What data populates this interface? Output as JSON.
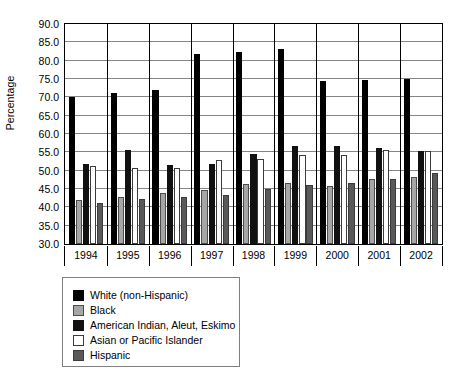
{
  "chart_data": {
    "type": "bar",
    "title": "",
    "subtitle": "",
    "xlabel": "",
    "ylabel": "Percentage",
    "categories": [
      "1994",
      "1995",
      "1996",
      "1997",
      "1998",
      "1999",
      "2000",
      "2001",
      "2002"
    ],
    "ylim": [
      30.0,
      90.0
    ],
    "ytick_step": 5.0,
    "yticks": [
      "90.0",
      "85.0",
      "80.0",
      "75.0",
      "70.0",
      "65.0",
      "60.0",
      "55.0",
      "50.0",
      "45.0",
      "40.0",
      "35.0",
      "30.0"
    ],
    "grid": true,
    "legend_position": "below-left",
    "series": [
      {
        "name": "White (non-Hispanic)",
        "color": "#000000",
        "values": [
          70.0,
          71.1,
          71.9,
          81.8,
          82.5,
          83.2,
          74.5,
          74.7,
          75.0
        ]
      },
      {
        "name": "Black",
        "color": "#a6a6a6",
        "values": [
          42.0,
          42.8,
          44.0,
          44.8,
          46.3,
          46.7,
          45.9,
          47.7,
          48.2
        ]
      },
      {
        "name": "American Indian, Aleut, Eskimo",
        "color": "#111111",
        "values": [
          51.8,
          55.7,
          51.5,
          51.8,
          54.5,
          56.7,
          56.7,
          56.2,
          55.5
        ]
      },
      {
        "name": "Asian or Pacific Islander",
        "color": "#ffffff",
        "values": [
          51.2,
          50.8,
          50.7,
          52.9,
          53.2,
          54.3,
          54.4,
          55.6,
          55.4
        ]
      },
      {
        "name": "Hispanic",
        "color": "#595959",
        "values": [
          41.3,
          42.2,
          42.9,
          43.5,
          45.1,
          46.0,
          46.7,
          47.7,
          49.5
        ]
      }
    ]
  },
  "axis": {
    "y_title": "Percentage"
  },
  "legend": {
    "items": [
      {
        "label": "White (non-Hispanic)",
        "swatch": "legend-swatch-white-non-hispanic"
      },
      {
        "label": "Black",
        "swatch": "legend-swatch-black"
      },
      {
        "label": "American Indian, Aleut, Eskimo",
        "swatch": "legend-swatch-american-indian"
      },
      {
        "label": "Asian or Pacific Islander",
        "swatch": "legend-swatch-asian-pacific-islander"
      },
      {
        "label": "Hispanic",
        "swatch": "legend-swatch-hispanic"
      }
    ]
  }
}
